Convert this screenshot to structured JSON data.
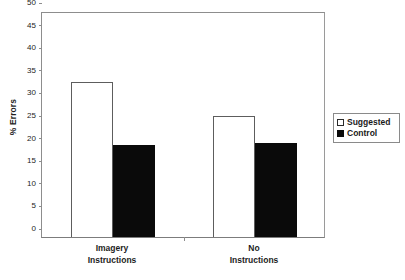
{
  "chart_data": {
    "type": "bar",
    "title": "",
    "xlabel": "",
    "ylabel": "% Errors",
    "ylim": [
      0,
      50
    ],
    "yticks": [
      0,
      5,
      10,
      15,
      20,
      25,
      30,
      35,
      40,
      45,
      50
    ],
    "ytick_labels": [
      "0",
      "5",
      "10",
      "15",
      "20",
      "25",
      "30",
      "35",
      "40",
      "45",
      "50"
    ],
    "grid": false,
    "legend_position": "right",
    "categories": [
      "Imagery Instructions",
      "No Instructions"
    ],
    "category_lines": [
      [
        "Imagery",
        "Instructions"
      ],
      [
        "No",
        "Instructions"
      ]
    ],
    "series": [
      {
        "name": "Suggested",
        "color": "#ffffff",
        "edge_color": "#000000",
        "values": [
          34.2,
          26.7
        ]
      },
      {
        "name": "Control",
        "color": "#000000",
        "edge_color": "#000000",
        "values": [
          20.4,
          20.9
        ]
      }
    ]
  },
  "legend": {
    "items": [
      {
        "label": "Suggested",
        "swatch": "hollow-square-icon"
      },
      {
        "label": "Control",
        "swatch": "filled-square-icon"
      }
    ]
  }
}
